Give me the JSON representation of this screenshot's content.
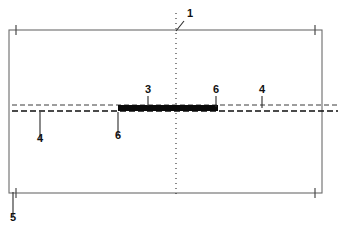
{
  "figure": {
    "type": "patent-line-drawing",
    "background_color": "#ffffff",
    "line_color": "#6b6b6b",
    "bar_color": "#0a0a0a",
    "label_color": "#111111"
  },
  "geometry": {
    "outline": {
      "name": "main-rectangle",
      "x": 9,
      "y": 30,
      "width": 313,
      "height": 163,
      "stroke_width": 1.1
    },
    "centerline": {
      "name": "vertical-centerline",
      "x": 176,
      "y_top": 13,
      "y_bottom": 196,
      "dash": "1,4"
    },
    "dashed_line_upper": {
      "name": "upper-dashed-line",
      "x_start": 12,
      "x_end": 338,
      "y": 105,
      "dash": "5,3",
      "stroke_width": 1.0
    },
    "dashed_line_lower": {
      "name": "lower-dashed-line",
      "x_start": 12,
      "x_end": 338,
      "y": 111,
      "dash": "6,3",
      "stroke_width": 1.4
    },
    "thick_bar": {
      "name": "reinforcement-bar",
      "x_start": 118,
      "x_end": 218,
      "y": 108,
      "thickness": 6
    }
  },
  "labels": [
    {
      "id": "callout-1",
      "text": "1",
      "x": 190,
      "y": 17,
      "leader": {
        "x1": 184,
        "y1": 21,
        "x2": 176,
        "y2": 31
      },
      "meaning": "panel-assembly"
    },
    {
      "id": "callout-3",
      "text": "3",
      "x": 148,
      "y": 93,
      "leader": {
        "x1": 148,
        "y1": 96,
        "x2": 148,
        "y2": 106
      },
      "meaning": "reinforcement-bar"
    },
    {
      "id": "callout-6-right",
      "text": "6",
      "x": 216,
      "y": 93,
      "leader": {
        "x1": 216,
        "y1": 96,
        "x2": 216,
        "y2": 107
      },
      "meaning": "bar-end-right"
    },
    {
      "id": "callout-4-right",
      "text": "4",
      "x": 262,
      "y": 93,
      "leader": {
        "x1": 262,
        "y1": 96,
        "x2": 262,
        "y2": 108
      },
      "meaning": "bond-layer-right"
    },
    {
      "id": "callout-6-left",
      "text": "6",
      "x": 118,
      "y": 139,
      "leader": {
        "x1": 118,
        "y1": 136,
        "x2": 118,
        "y2": 112
      },
      "meaning": "bar-end-left"
    },
    {
      "id": "callout-4-left",
      "text": "4",
      "x": 40,
      "y": 142,
      "leader": {
        "x1": 40,
        "y1": 139,
        "x2": 40,
        "y2": 112
      },
      "meaning": "bond-layer-left"
    },
    {
      "id": "callout-5",
      "text": "5",
      "x": 13,
      "y": 221,
      "leader": {
        "x1": 13,
        "y1": 217,
        "x2": 13,
        "y2": 192
      },
      "meaning": "panel-edge"
    }
  ],
  "dimension_ticks": [
    {
      "id": "tick-top-left",
      "x": 16,
      "y": 30
    },
    {
      "id": "tick-top-right",
      "x": 315,
      "y": 30
    },
    {
      "id": "tick-bottom-left",
      "x": 16,
      "y": 193
    },
    {
      "id": "tick-bottom-right",
      "x": 315,
      "y": 193
    }
  ]
}
